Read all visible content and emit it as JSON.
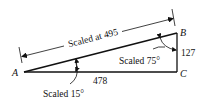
{
  "diagram": {
    "type": "right-triangle-measurement",
    "vertices": {
      "A": "A",
      "B": "B",
      "C": "C"
    },
    "labels": {
      "hypotenuse": "Scaled at 495",
      "base": "478",
      "height": "127",
      "angle_A": "Scaled 15°",
      "angle_B": "Scaled 75°"
    },
    "colors": {
      "line": "#111111",
      "background": "#ffffff"
    }
  }
}
